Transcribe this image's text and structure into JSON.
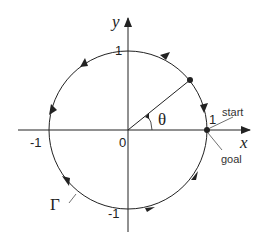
{
  "diagram": {
    "axes": {
      "x_label": "x",
      "y_label": "y",
      "origin_label": "0"
    },
    "ticks": {
      "x_pos": "1",
      "x_neg": "-1",
      "y_pos": "1",
      "y_neg": "-1"
    },
    "angle_label": "θ",
    "contour_label": "Γ",
    "annotations": {
      "start": "start",
      "goal": "goal"
    },
    "direction": "counterclockwise",
    "colors": {
      "stroke": "#222222",
      "background": "#ffffff"
    }
  }
}
